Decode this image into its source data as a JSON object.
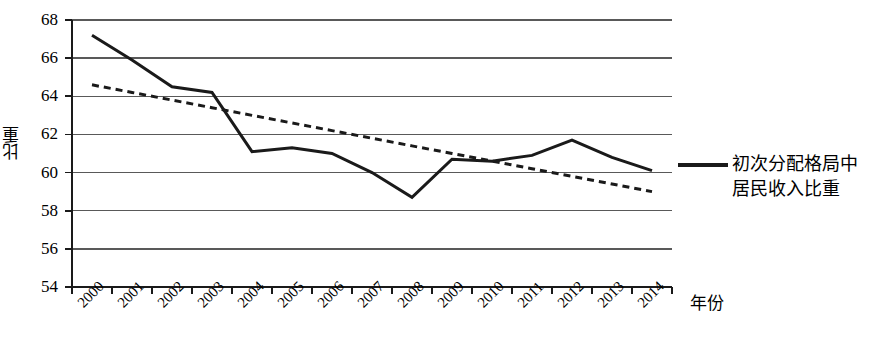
{
  "chart_data": {
    "type": "line",
    "title": "",
    "xlabel": "年份",
    "ylabel": "比重",
    "categories": [
      "2000",
      "2001",
      "2002",
      "2003",
      "2004",
      "2005",
      "2006",
      "2007",
      "2008",
      "2009",
      "2010",
      "2011",
      "2012",
      "2013",
      "2014"
    ],
    "ylim": [
      54,
      68
    ],
    "ytick_labels": [
      "68",
      "66",
      "64",
      "62",
      "60",
      "58",
      "56",
      "54"
    ],
    "ytick_values": [
      68,
      66,
      64,
      62,
      60,
      58,
      56,
      54
    ],
    "ytick_step": 2,
    "grid": true,
    "grid_axis": "y",
    "legend_position": "right",
    "series": [
      {
        "name": "初次分配格局中居民收入比重",
        "style": "solid",
        "color": "#1a1a1a",
        "values": [
          67.2,
          65.9,
          64.5,
          64.2,
          61.1,
          61.3,
          61.0,
          60.0,
          58.7,
          60.7,
          60.6,
          60.9,
          61.7,
          60.8,
          60.1
        ]
      },
      {
        "name": "线性趋势线",
        "style": "dashed",
        "color": "#1a1a1a",
        "show_in_legend": false,
        "values": [
          64.6,
          64.2,
          63.8,
          63.4,
          63.0,
          62.6,
          62.2,
          61.8,
          61.4,
          61.0,
          60.6,
          60.2,
          59.8,
          59.4,
          59.0
        ]
      }
    ]
  },
  "legend": {
    "entries": [
      {
        "marker": "solid-line-marker",
        "line1": "初次分配格局中",
        "line2": "居民收入比重"
      }
    ]
  },
  "axes": {
    "y_title": "比重",
    "x_title": "年份"
  }
}
